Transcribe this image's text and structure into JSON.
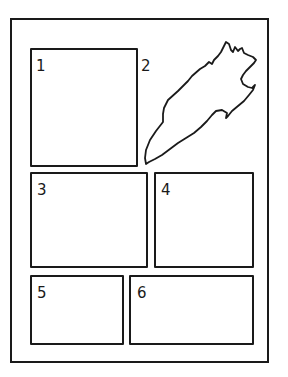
{
  "diagram": {
    "title": "",
    "frame": {
      "stroke": "#1a1a1a",
      "background": "#ffffff"
    },
    "panels": [
      {
        "id": 1,
        "label": "1",
        "shape": "rectangle"
      },
      {
        "id": 2,
        "label": "2",
        "shape": "freeform-torn"
      },
      {
        "id": 3,
        "label": "3",
        "shape": "rectangle"
      },
      {
        "id": 4,
        "label": "4",
        "shape": "rectangle"
      },
      {
        "id": 5,
        "label": "5",
        "shape": "rectangle"
      },
      {
        "id": 6,
        "label": "6",
        "shape": "rectangle"
      }
    ]
  }
}
